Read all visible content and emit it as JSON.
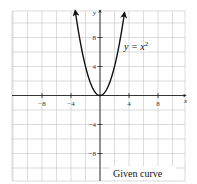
{
  "chart_data": {
    "type": "line",
    "title": "",
    "caption": "Given curve",
    "xlabel": "x",
    "ylabel": "y",
    "xlim": [
      -12,
      12
    ],
    "ylim": [
      -12,
      12
    ],
    "grid": true,
    "grid_step": 2,
    "x_ticks": [
      -8,
      -4,
      4,
      8
    ],
    "x_tick_labels": [
      "−8",
      "−4",
      "4",
      "8"
    ],
    "y_ticks": [
      8,
      4,
      -4,
      -8
    ],
    "y_tick_labels": [
      "8",
      "4",
      "−4",
      "−8"
    ],
    "series": [
      {
        "name": "y = x^2",
        "label": "y = x²",
        "equation": "y = x^2",
        "x": [
          -3.4,
          -3,
          -2.5,
          -2,
          -1.5,
          -1,
          -0.5,
          0,
          0.5,
          1,
          1.5,
          2,
          2.5,
          3,
          3.4
        ],
        "y": [
          11.56,
          9,
          6.25,
          4,
          2.25,
          1,
          0.25,
          0,
          0.25,
          1,
          2.25,
          4,
          6.25,
          9,
          11.56
        ],
        "arrows_at_ends": true
      }
    ],
    "annotations": [
      {
        "text": "y = x²",
        "x": 3.5,
        "y": 7.5
      }
    ]
  },
  "labels": {
    "x_axis": "x",
    "y_axis": "y",
    "curve_lhs": "y = x",
    "curve_exp": "2",
    "caption": "Given curve",
    "x_ticks": [
      "−8",
      "−4",
      "4",
      "8"
    ],
    "y_ticks": [
      "8",
      "4",
      "−4",
      "−8"
    ]
  },
  "colors": {
    "grid": "#c4c4c4",
    "axis": "#222222",
    "curve": "#111111",
    "background": "#ffffff"
  }
}
